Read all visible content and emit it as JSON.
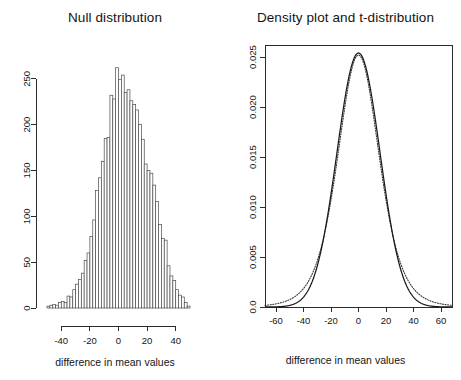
{
  "figure": {
    "background": "#ffffff",
    "width": 461,
    "height": 380,
    "panel_count": 2
  },
  "chart_data": [
    {
      "id": "null-distribution",
      "type": "bar",
      "title": "Null distribution",
      "subtitle": "",
      "xlabel": "difference in mean values",
      "ylabel": "",
      "grid": false,
      "legend": false,
      "xlim": [
        -50,
        50
      ],
      "ylim": [
        0,
        265
      ],
      "xticks": [
        -40,
        -20,
        0,
        20,
        40
      ],
      "xtick_labels": [
        "-40",
        "-20",
        "0",
        "20",
        "40"
      ],
      "yticks": [
        0,
        50,
        100,
        150,
        200,
        250
      ],
      "ytick_labels": [
        "0",
        "50",
        "100",
        "150",
        "200",
        "250"
      ],
      "bin_width": 2,
      "bin_centers": [
        -49,
        -47,
        -45,
        -43,
        -41,
        -39,
        -37,
        -35,
        -33,
        -31,
        -29,
        -27,
        -25,
        -23,
        -21,
        -19,
        -17,
        -15,
        -13,
        -11,
        -9,
        -7,
        -5,
        -3,
        -1,
        1,
        3,
        5,
        7,
        9,
        11,
        13,
        15,
        17,
        19,
        21,
        23,
        25,
        27,
        29,
        31,
        33,
        35,
        37,
        39,
        41,
        43,
        45,
        47,
        49
      ],
      "values": [
        2,
        3,
        4,
        3,
        6,
        7,
        6,
        13,
        12,
        20,
        26,
        31,
        38,
        52,
        60,
        78,
        96,
        128,
        142,
        160,
        185,
        186,
        232,
        228,
        262,
        249,
        254,
        235,
        238,
        226,
        222,
        216,
        200,
        184,
        157,
        150,
        147,
        134,
        116,
        91,
        76,
        74,
        46,
        35,
        30,
        20,
        14,
        12,
        6,
        2
      ]
    },
    {
      "id": "density-and-t",
      "type": "line",
      "title": "Density plot and t-distribution",
      "subtitle": "",
      "xlabel": "difference in mean values",
      "ylabel": "",
      "grid": false,
      "legend": false,
      "box_frame": true,
      "xlim": [
        -68,
        68
      ],
      "ylim": [
        0,
        0.0262
      ],
      "xticks": [
        -60,
        -40,
        -20,
        0,
        20,
        40,
        60
      ],
      "xtick_labels": [
        "-60",
        "-40",
        "-20",
        "0",
        "20",
        "40",
        "60"
      ],
      "yticks": [
        0,
        0.005,
        0.01,
        0.015,
        0.02,
        0.025
      ],
      "ytick_labels": [
        "0.0",
        "0.005",
        "0.010",
        "0.015",
        "0.020",
        "0.025"
      ],
      "series": [
        {
          "name": "density estimate",
          "style": "solid",
          "color": "#1a1a1a",
          "model": "normal",
          "mean": 0,
          "sd": 15.7,
          "peak": 0.0254
        },
        {
          "name": "t-distribution",
          "style": "dotted",
          "color": "#2e2e2e",
          "model": "student-t",
          "df": 6,
          "scale": 15.5,
          "peak": 0.0252
        }
      ]
    }
  ]
}
